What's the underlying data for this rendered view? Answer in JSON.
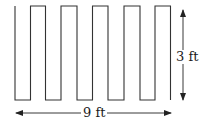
{
  "diagram": {
    "type": "zigzag-wall",
    "shape": "square-wave outline with 5 raised teeth (open top ends at left and right)",
    "stroke_color": "#333333",
    "labels": {
      "height": "3 ft",
      "width": "9 ft"
    },
    "dimensions": {
      "height_ft": 3,
      "width_ft": 9
    }
  }
}
